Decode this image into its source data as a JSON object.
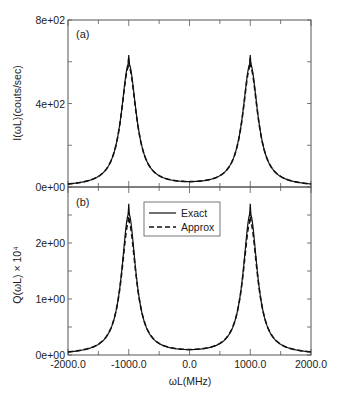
{
  "chart_data": [
    {
      "panel": "(a)",
      "type": "line",
      "title": "",
      "xlabel": "ωL (MHz)",
      "ylabel": "I(ωL)(couts/sec)",
      "xlim": [
        -2000,
        2000
      ],
      "ylim": [
        0,
        800
      ],
      "yticks": [
        "0e+00",
        "4e+02",
        "8e+02"
      ],
      "ytick_values": [
        0,
        400,
        800
      ],
      "yminor": [
        200,
        600
      ],
      "xticks": [
        -2000,
        -1500,
        -1000,
        -500,
        0,
        500,
        1000,
        1500,
        2000
      ],
      "grid": false,
      "legend": null,
      "series": [
        {
          "name": "Exact",
          "style": "solid",
          "model": {
            "centers": [
              -1000,
              1000
            ],
            "peak": 632,
            "gamma": 150
          },
          "x": [
            -2000,
            -1500,
            -1200,
            -1100,
            -1000,
            -900,
            -800,
            -500,
            0,
            500,
            800,
            900,
            1000,
            1100,
            1200,
            1500,
            2000
          ],
          "values": [
            14,
            53,
            227,
            440,
            632,
            440,
            227,
            72,
            24,
            72,
            227,
            440,
            632,
            440,
            227,
            53,
            14
          ]
        },
        {
          "name": "Approx",
          "style": "dashed",
          "model": {
            "centers": [
              -1000,
              1000
            ],
            "peak": 618,
            "gamma": 152
          },
          "x": [
            -2000,
            -1500,
            -1200,
            -1100,
            -1000,
            -900,
            -800,
            -500,
            0,
            500,
            800,
            900,
            1000,
            1100,
            1200,
            1500,
            2000
          ],
          "values": [
            14,
            53,
            226,
            437,
            618,
            437,
            226,
            72,
            24,
            72,
            226,
            437,
            618,
            437,
            226,
            53,
            14
          ]
        }
      ]
    },
    {
      "panel": "(b)",
      "type": "line",
      "title": "",
      "xlabel": "ωL (MHz)",
      "ylabel": "Q(ωL) × 10⁴",
      "xlim": [
        -2000,
        2000
      ],
      "ylim": [
        0,
        3
      ],
      "yticks": [
        "0e+00",
        "1e+00",
        "2e+00"
      ],
      "ytick_values": [
        0,
        1,
        2
      ],
      "yminor": [
        0.5,
        1.5,
        2.5
      ],
      "xticks": [
        "-2000.0",
        "-1000.0",
        "0.0",
        "1000.0",
        "2000.0"
      ],
      "xtick_values": [
        -2000,
        -1000,
        0,
        1000,
        2000
      ],
      "xminor": [
        -1500,
        -500,
        500,
        1500
      ],
      "grid": false,
      "legend": {
        "position": "upper center",
        "entries": [
          "Exact",
          "Approx"
        ]
      },
      "series": [
        {
          "name": "Exact",
          "style": "solid",
          "model": {
            "centers": [
              -1000,
              1000
            ],
            "peak": 2.7,
            "gamma": 140
          },
          "x": [
            -2000,
            -1500,
            -1200,
            -1100,
            -1000,
            -900,
            -800,
            -500,
            0,
            500,
            800,
            900,
            1000,
            1100,
            1200,
            1500,
            2000
          ],
          "values": [
            0.05,
            0.2,
            0.88,
            1.79,
            2.7,
            1.79,
            0.88,
            0.27,
            0.12,
            0.27,
            0.88,
            1.79,
            2.7,
            1.79,
            0.88,
            0.2,
            0.05
          ]
        },
        {
          "name": "Approx",
          "style": "dashed",
          "model": {
            "centers": [
              -1000,
              1000
            ],
            "peak": 2.55,
            "gamma": 146
          },
          "x": [
            -2000,
            -1500,
            -1200,
            -1100,
            -1000,
            -900,
            -800,
            -500,
            0,
            500,
            800,
            900,
            1000,
            1100,
            1200,
            1500,
            2000
          ],
          "values": [
            0.05,
            0.2,
            0.88,
            1.75,
            2.55,
            1.75,
            0.88,
            0.27,
            0.12,
            0.27,
            0.88,
            1.75,
            2.55,
            1.75,
            0.88,
            0.2,
            0.05
          ]
        }
      ]
    }
  ],
  "labels": {
    "panel_a": "(a)",
    "panel_b": "(b)",
    "ylabel_a": "I(ωL)(couts/sec)",
    "ylabel_b": "Q(ωL) × 10⁴",
    "xlabel": "ωL(MHz)",
    "legend_exact": "Exact",
    "legend_approx": "Approx"
  },
  "colors": {
    "line": "#111111",
    "frame": "#555555",
    "text": "#222222"
  }
}
